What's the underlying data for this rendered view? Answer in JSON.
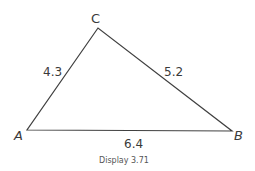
{
  "figure": {
    "caption": "Display 3.71",
    "triangle": {
      "vertices": {
        "A": {
          "label": "A",
          "x": 27,
          "y": 130
        },
        "B": {
          "label": "B",
          "x": 232,
          "y": 131
        },
        "C": {
          "label": "C",
          "x": 98,
          "y": 28
        }
      },
      "sides": {
        "AC": {
          "length": "4.3"
        },
        "CB": {
          "length": "5.2"
        },
        "AB": {
          "length": "6.4"
        }
      },
      "stroke_color": "#404040"
    }
  }
}
